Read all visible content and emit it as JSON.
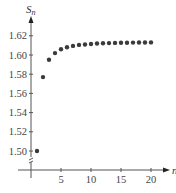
{
  "chart_data": {
    "type": "scatter",
    "title": "",
    "xlabel": "n",
    "ylabel": "S_n",
    "ylabel_display": {
      "main": "S",
      "sub": "n"
    },
    "xlim": [
      0,
      22
    ],
    "ylim": [
      1.49,
      1.63
    ],
    "x_ticks": [
      5,
      10,
      15,
      20
    ],
    "x_tick_labels": [
      "5",
      "10",
      "15",
      "20"
    ],
    "y_ticks": [
      1.5,
      1.52,
      1.54,
      1.56,
      1.58,
      1.6,
      1.62
    ],
    "y_tick_labels": [
      "1.50",
      "1.52",
      "1.54",
      "1.56",
      "1.58",
      "1.60",
      "1.62"
    ],
    "y_axis_break": true,
    "grid": false,
    "legend": null,
    "x": [
      1,
      2,
      3,
      4,
      5,
      6,
      7,
      8,
      9,
      10,
      11,
      12,
      13,
      14,
      15,
      16,
      17,
      18,
      19,
      20
    ],
    "values": [
      1.5,
      1.577,
      1.595,
      1.602,
      1.606,
      1.608,
      1.6095,
      1.6105,
      1.611,
      1.6115,
      1.612,
      1.6122,
      1.6124,
      1.6126,
      1.6127,
      1.6128,
      1.6129,
      1.613,
      1.613,
      1.6131
    ],
    "colors": {
      "points": "#3a3a3a",
      "axis": "#555555"
    }
  }
}
